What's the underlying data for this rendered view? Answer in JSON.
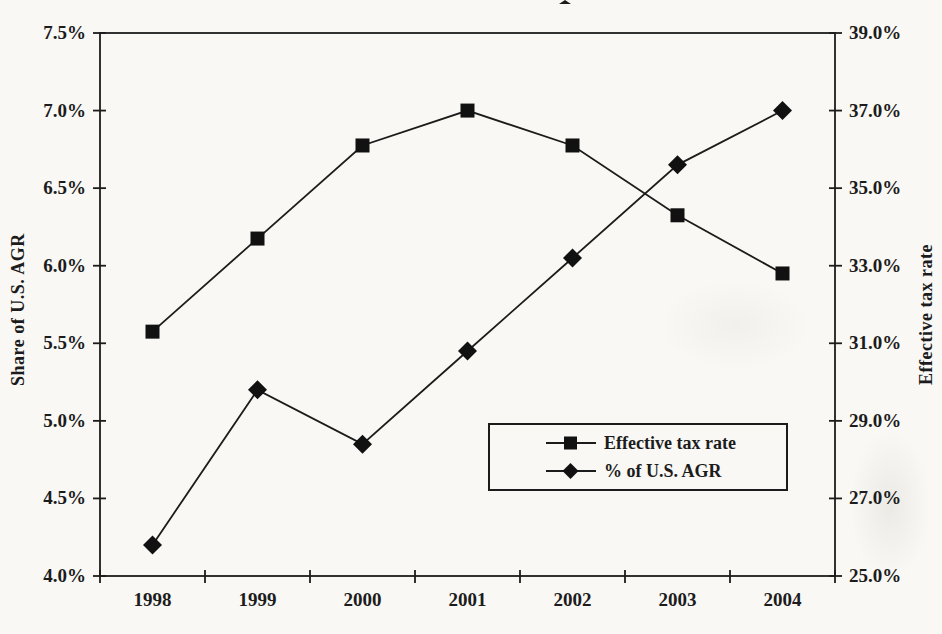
{
  "page": {
    "paper_color": "#f9f8f4",
    "ink_color": "#1c1c1c"
  },
  "chart_data": {
    "type": "line",
    "categories": [
      "1998",
      "1999",
      "2000",
      "2001",
      "2002",
      "2003",
      "2004"
    ],
    "series": [
      {
        "name": "Effective tax rate",
        "marker": "square",
        "axis": "right",
        "values": [
          31.3,
          33.7,
          36.1,
          37.0,
          36.1,
          34.3,
          32.8
        ]
      },
      {
        "name": "% of U.S. AGR",
        "marker": "diamond",
        "axis": "left",
        "values": [
          4.2,
          5.2,
          4.85,
          5.45,
          6.05,
          6.65,
          7.0
        ]
      }
    ],
    "left_axis": {
      "label": "Share of U.S. AGR",
      "min": 4.0,
      "max": 7.5,
      "step": 0.5,
      "tick_labels": [
        "7.5%",
        "7.0%",
        "6.5%",
        "6.0%",
        "5.5%",
        "5.0%",
        "4.5%",
        "4.0%"
      ]
    },
    "right_axis": {
      "label": "Effective tax rate",
      "min": 25.0,
      "max": 39.0,
      "step": 2.0,
      "tick_labels": [
        "39.0%",
        "37.0%",
        "35.0%",
        "33.0%",
        "31.0%",
        "29.0%",
        "27.0%",
        "25.0%"
      ]
    },
    "x_axis": {
      "tick_labels": [
        "1998",
        "1999",
        "2000",
        "2001",
        "2002",
        "2003",
        "2004"
      ]
    },
    "legend": {
      "position": "inside-lower-right"
    },
    "grid": false
  }
}
